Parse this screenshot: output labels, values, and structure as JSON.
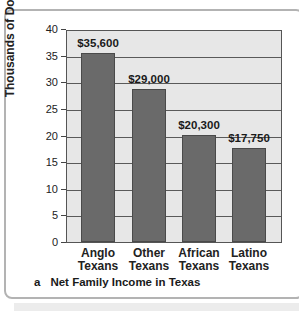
{
  "chart_data": {
    "type": "bar",
    "title": "Net Family Income in Texas",
    "panel_letter": "a",
    "xlabel": "",
    "ylabel": "Thousands of Dollars",
    "categories": [
      "Anglo Texans",
      "Other Texans",
      "African Texans",
      "Latino Texans"
    ],
    "category_lines": [
      [
        "Anglo",
        "Texans"
      ],
      [
        "Other",
        "Texans"
      ],
      [
        "African",
        "Texans"
      ],
      [
        "Latino",
        "Texans"
      ]
    ],
    "values": [
      35.6,
      29.0,
      20.3,
      17.75
    ],
    "value_labels": [
      "$35,600",
      "$29,000",
      "$20,300",
      "$17,750"
    ],
    "ylim": [
      0,
      40
    ],
    "yticks": [
      0,
      5,
      10,
      15,
      20,
      25,
      30,
      35,
      40
    ],
    "grid": true,
    "legend": null,
    "colors": {
      "bar": "#6a6a6a",
      "plot_bg": "#e7e7e7",
      "grid": "#5a5a5a"
    }
  }
}
